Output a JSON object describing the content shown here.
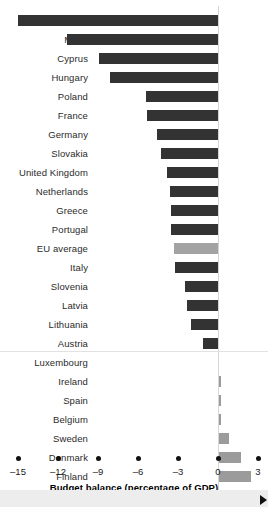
{
  "chart_data": {
    "type": "bar",
    "orientation": "horizontal",
    "title": "",
    "xlabel": "Budget balance (percentage of GDP)",
    "ylabel": "",
    "xlim": [
      -16.5,
      4.5
    ],
    "xticks": [
      -15,
      -12,
      -9,
      -6,
      -3,
      0,
      3
    ],
    "xtick_labels": [
      "–15",
      "–12",
      "–9",
      "–6",
      "–3",
      "0",
      "3"
    ],
    "grid": false,
    "legend": false,
    "colors": {
      "negative_bar": "#333333",
      "positive_bar": "#9b9b9b",
      "average_bar": "#a3a3a3",
      "zero_line": "#d6d6d6",
      "separator_line": "#e2e2e2",
      "bottom_band": "#ededed",
      "text": "#2b2b2b"
    },
    "categories": [
      "Czech Republic",
      "Malta",
      "Cyprus",
      "Hungary",
      "Poland",
      "France",
      "Germany",
      "Slovakia",
      "United Kingdom",
      "Netherlands",
      "Greece",
      "Portugal",
      "EU  average",
      "Italy",
      "Slovenia",
      "Latvia",
      "Lithuania",
      "Austria",
      "Luxembourg",
      "Ireland",
      "Spain",
      "Belgium",
      "Sweden",
      "Denmark",
      "Finland",
      "Estonia"
    ],
    "values": [
      -15.0,
      -11.3,
      -8.9,
      -8.1,
      -5.4,
      -5.3,
      -4.6,
      -4.3,
      -3.8,
      -3.6,
      -3.5,
      -3.5,
      -3.3,
      -3.2,
      -2.5,
      -2.3,
      -2.0,
      -1.1,
      0.0,
      0.2,
      0.2,
      0.2,
      0.8,
      1.7,
      2.5,
      2.3
    ],
    "bar_kinds": [
      "neg",
      "neg",
      "neg",
      "neg",
      "neg",
      "neg",
      "neg",
      "neg",
      "neg",
      "neg",
      "neg",
      "neg",
      "avg",
      "neg",
      "neg",
      "neg",
      "neg",
      "neg",
      "pos",
      "pos",
      "pos",
      "pos",
      "pos",
      "pos",
      "pos",
      "pos"
    ],
    "separator_after_category": "Austria"
  }
}
